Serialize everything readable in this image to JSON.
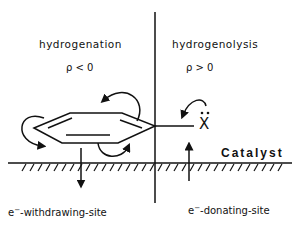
{
  "left_panel": {
    "title": "hydrogenation",
    "rho": "ρ < 0",
    "site_prefix": "e",
    "site_sup": "−",
    "site_label": "-withdrawing-site"
  },
  "right_panel": {
    "title": "hydrogenolysis",
    "rho": "ρ > 0",
    "site_prefix": "e",
    "site_sup": "−",
    "site_label": "-donating-site",
    "leaving_group": "X"
  },
  "surface": {
    "label": "Catalyst"
  }
}
